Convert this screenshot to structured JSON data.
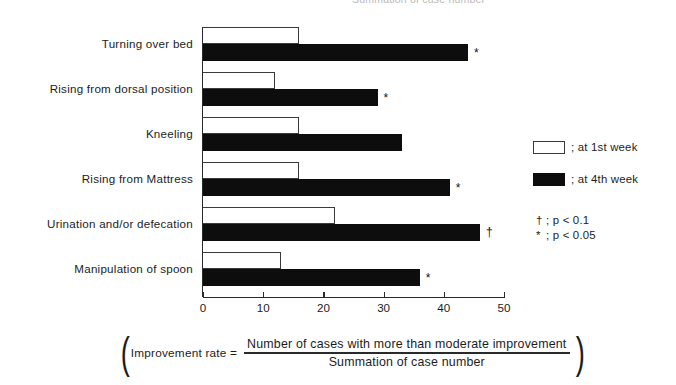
{
  "clipped_top_text": "Summation of case number",
  "chart_data": {
    "type": "bar",
    "orientation": "horizontal",
    "title": "",
    "xlabel": "",
    "ylabel": "",
    "xlim": [
      0,
      50
    ],
    "xticks": [
      0,
      10,
      20,
      30,
      40,
      50
    ],
    "xtick_labels": [
      "0",
      "10",
      "20",
      "30",
      "40",
      "50"
    ],
    "grid": false,
    "legend_position": "right",
    "categories": [
      "Turning over bed",
      "Rising from dorsal position",
      "Kneeling",
      "Rising from Mattress",
      "Urination and/or defecation",
      "Manipulation of spoon"
    ],
    "series": [
      {
        "name": "at 1st week",
        "style": "open",
        "values": [
          16,
          12,
          16,
          16,
          22,
          13
        ]
      },
      {
        "name": "at 4th week",
        "style": "filled",
        "values": [
          44,
          29,
          33,
          41,
          46,
          36
        ]
      }
    ],
    "significance_marks": [
      "*",
      "*",
      "",
      "*",
      "†",
      "*"
    ],
    "annotations": [
      "* marks bars significant at p < 0.05",
      "† marks bar significant at p < 0.1"
    ]
  },
  "legend": {
    "items": [
      {
        "style": "open",
        "label": "; at 1st week"
      },
      {
        "style": "filled",
        "label": "; at 4th week"
      }
    ],
    "pnotes": [
      {
        "mark": "†",
        "text": "; p < 0.1"
      },
      {
        "mark": "*",
        "text": "; p < 0.05"
      }
    ]
  },
  "formula": {
    "lparen": "(",
    "lhs": "Improvement rate =",
    "numerator": "Number of cases with more than moderate improvement",
    "denominator": "Summation of case number",
    "rparen": ")"
  }
}
